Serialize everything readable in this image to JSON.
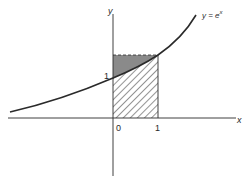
{
  "figure": {
    "curve_label": "y = e",
    "curve_label_exponent": "x",
    "y_axis_label": "y",
    "x_axis_label": "x",
    "y_tick_1": "1",
    "x_tick_0": "0",
    "x_tick_1": "1"
  },
  "colors": {
    "ink": "#2a2a2a",
    "shaded_region": "#8a8a8a",
    "background": "#ffffff"
  }
}
